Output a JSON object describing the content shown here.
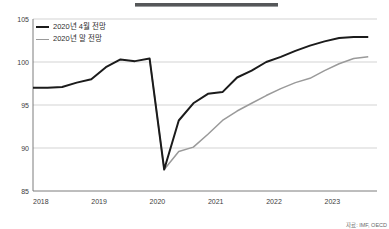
{
  "figure": {
    "title_rule_present": true,
    "source_note": "자료: IMF, OECD",
    "colors": {
      "series_dark": "#1b1b1b",
      "series_gray": "#9a9a9a",
      "gridline": "#c8c8c8",
      "axis": "#6e6e6e",
      "background": "#ffffff",
      "title_rule": "#555759"
    }
  },
  "legend": {
    "position": "top-left-inside",
    "entries": [
      {
        "label": "2020년 4월 전망",
        "swatch": "dark"
      },
      {
        "label": "2020년 말 전망",
        "swatch": "gray"
      }
    ]
  },
  "chart_data": {
    "type": "line",
    "title": "",
    "subtitle": "",
    "xlabel": "",
    "ylabel": "",
    "grid": true,
    "legend_position": "top-left",
    "xlim": [
      2018.0,
      2023.9
    ],
    "ylim": [
      85,
      105
    ],
    "yticks": [
      85,
      90,
      95,
      100,
      105
    ],
    "ytick_labels": [
      "85",
      "90",
      "95",
      "100",
      "105"
    ],
    "xticks": [
      2018,
      2019,
      2020,
      2021,
      2022,
      2023
    ],
    "xtick_labels": [
      "2018",
      "2019",
      "2020",
      "2021",
      "2022",
      "2023"
    ],
    "annotations": [],
    "series": [
      {
        "name": "2020년 4월 전망",
        "color": "#1b1b1b",
        "x": [
          2018.0,
          2018.25,
          2018.5,
          2018.75,
          2019.0,
          2019.25,
          2019.5,
          2019.75,
          2020.0,
          2020.25,
          2020.5,
          2020.75,
          2021.0,
          2021.25,
          2021.5,
          2021.75,
          2022.0,
          2022.25,
          2022.5,
          2022.75,
          2023.0,
          2023.25,
          2023.5,
          2023.75
        ],
        "values": [
          97.0,
          97.0,
          97.1,
          97.6,
          98.0,
          99.4,
          100.3,
          100.1,
          100.4,
          87.5,
          93.2,
          95.2,
          96.3,
          96.5,
          98.2,
          99.0,
          100.0,
          100.6,
          101.3,
          101.9,
          102.4,
          102.8,
          102.9,
          102.9
        ]
      },
      {
        "name": "2020년 말 전망",
        "color": "#9a9a9a",
        "x": [
          2020.0,
          2020.25,
          2020.5,
          2020.75,
          2021.0,
          2021.25,
          2021.5,
          2021.75,
          2022.0,
          2022.25,
          2022.5,
          2022.75,
          2023.0,
          2023.25,
          2023.5,
          2023.75
        ],
        "values": [
          100.4,
          87.5,
          89.6,
          90.1,
          91.6,
          93.2,
          94.3,
          95.2,
          96.1,
          96.9,
          97.6,
          98.1,
          99.0,
          99.8,
          100.4,
          100.6
        ]
      }
    ]
  }
}
